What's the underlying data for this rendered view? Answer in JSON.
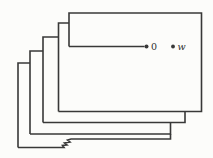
{
  "figure": {
    "width": 213,
    "height": 158,
    "background": "#fcfcfa",
    "ink": "#383838",
    "stroke_width": 1.6,
    "paths": [
      {
        "name": "front-sheet-outline",
        "d": "M 69,46.5 L 69,13 L 201.5,13 L 201.5,111.5 L 58.5,111.5"
      },
      {
        "name": "sheet2-left-edge",
        "d": "M 58.5,111.5 L 58.5,23 L 69,23"
      },
      {
        "name": "sheet2-bottom-right-edge",
        "d": "M 185,111.5 L 185,122.5 L 43,122.5"
      },
      {
        "name": "sheet3-left-edge",
        "d": "M 43,122.5 L 43,37 L 58.5,37"
      },
      {
        "name": "sheet3-bottom-right-edge",
        "d": "M 170.5,122.5 L 170.5,134 L 30,134"
      },
      {
        "name": "sheet4-left-edge",
        "d": "M 30,134 L 30,51 L 43,51"
      },
      {
        "name": "sheet4-bottom-torn-edge",
        "d": "M 170.5,134 L 170.5,139 L 71,139 L 67.5,140 L 70,142 L 64.5,143 L 67,145 L 62.5,145.5 L 64,147.5 L 18,147.5"
      },
      {
        "name": "sheet5-left-edge",
        "d": "M 18,147.5 L 18,63 L 30,63"
      },
      {
        "name": "cut-line-to-branch-point",
        "d": "M 69,46.5 L 144.5,46.5"
      }
    ],
    "points": [
      {
        "name": "branch-point-0-dot",
        "label": "0",
        "x": 146.5,
        "y": 46.5,
        "r": 2,
        "label_x": 151,
        "label_y": 46.5,
        "italic": false
      },
      {
        "name": "point-w-dot",
        "label": "w",
        "x": 173,
        "y": 46.5,
        "r": 1.9,
        "label_x": 177.5,
        "label_y": 46.5,
        "italic": true
      }
    ]
  }
}
